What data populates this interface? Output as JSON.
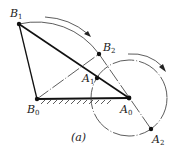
{
  "figure": {
    "caption": "(a)",
    "points": {
      "B1": {
        "label": "B",
        "sub": "1"
      },
      "B2": {
        "label": "B",
        "sub": "2"
      },
      "A1": {
        "label": "A",
        "sub": "1"
      },
      "A0": {
        "label": "A",
        "sub": "0"
      },
      "A2": {
        "label": "A",
        "sub": "2"
      },
      "B0": {
        "label": "B",
        "sub": "0"
      }
    },
    "elements": [
      "ground-link-B0-A0",
      "link-B0-B1",
      "link-B1-A0",
      "dash-dot-B0-B2",
      "dash-dot-B2-A2",
      "arc-B1-B2",
      "circle-center-A0",
      "rotation-arrow-arc",
      "rotation-arrow-circle"
    ]
  }
}
